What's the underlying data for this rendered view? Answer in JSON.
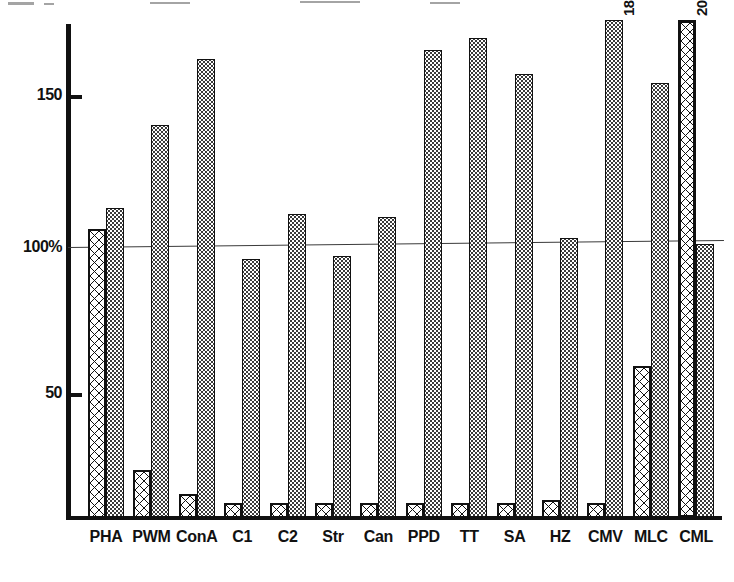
{
  "chart_data": {
    "type": "bar",
    "title": "",
    "xlabel": "",
    "ylabel": "",
    "ylim": [
      8,
      175
    ],
    "grid": false,
    "legend_position": "none",
    "reference_line": {
      "value": 100,
      "label": "100%"
    },
    "y_ticks": [
      {
        "value": 150,
        "label": "150"
      },
      {
        "value": 100,
        "label": "100%"
      },
      {
        "value": 50,
        "label": "50"
      }
    ],
    "categories": [
      "PHA",
      "PWM",
      "ConA",
      "C1",
      "C2",
      "Str",
      "Can",
      "PPD",
      "TT",
      "SA",
      "HZ",
      "CMV",
      "MLC",
      "CML"
    ],
    "series": [
      {
        "name": "crosshatched",
        "pattern": "crosshatch",
        "values": [
          105,
          24,
          16,
          13,
          13,
          13,
          13,
          13,
          13,
          13,
          14,
          13,
          59,
          200
        ],
        "truncated": [
          false,
          false,
          false,
          false,
          false,
          false,
          false,
          false,
          false,
          false,
          false,
          false,
          false,
          true
        ],
        "truncated_labels": [
          "",
          "",
          "",
          "",
          "",
          "",
          "",
          "",
          "",
          "",
          "",
          "",
          "",
          "200"
        ]
      },
      {
        "name": "dotted",
        "pattern": "stipple",
        "values": [
          112,
          140,
          162,
          95,
          110,
          96,
          109,
          165,
          169,
          157,
          102,
          180,
          154,
          100
        ],
        "truncated": [
          false,
          false,
          false,
          false,
          false,
          false,
          false,
          false,
          false,
          false,
          false,
          true,
          false,
          false
        ],
        "truncated_labels": [
          "",
          "",
          "",
          "",
          "",
          "",
          "",
          "",
          "",
          "",
          "",
          "180",
          "",
          ""
        ]
      }
    ]
  },
  "axis": {
    "tick_150": "150",
    "tick_100": "100%",
    "tick_50": "50"
  },
  "labels": {
    "pha": "PHA",
    "pwm": "PWM",
    "cona": "ConA",
    "c1": "C1",
    "c2": "C2",
    "str": "Str",
    "can": "Can",
    "ppd": "PPD",
    "tt": "TT",
    "sa": "SA",
    "hz": "HZ",
    "cmv": "CMV",
    "mlc": "MLC",
    "cml": "CML"
  },
  "annotations": {
    "cmv_truncated": "180",
    "cml_truncated": "200"
  },
  "colors": {
    "ink": "#111111",
    "stipple": "#3b3b3b",
    "reference_line": "#3a3a3a",
    "background": "#ffffff"
  }
}
